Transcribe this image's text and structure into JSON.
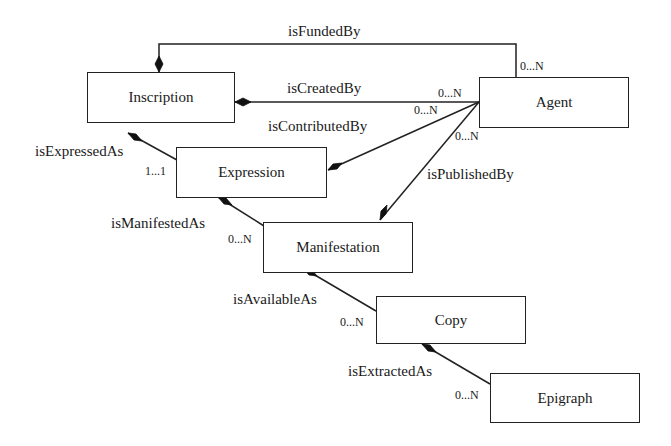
{
  "diagram": {
    "type": "UML class / entity-relationship diagram",
    "entities": [
      {
        "id": "inscription",
        "label": "Inscription"
      },
      {
        "id": "agent",
        "label": "Agent"
      },
      {
        "id": "expression",
        "label": "Expression"
      },
      {
        "id": "manifestation",
        "label": "Manifestation"
      },
      {
        "id": "copy",
        "label": "Copy"
      },
      {
        "id": "epigraph",
        "label": "Epigraph"
      }
    ],
    "relations": [
      {
        "id": "funded",
        "label": "isFundedBy",
        "from": "Inscription",
        "to": "Agent",
        "cardinality": "0...N"
      },
      {
        "id": "created",
        "label": "isCreatedBy",
        "from": "Inscription",
        "to": "Agent",
        "cardinality": "0...N"
      },
      {
        "id": "contributed",
        "label": "isContributedBy",
        "from": "Expression",
        "to": "Agent",
        "cardinality": "0...N"
      },
      {
        "id": "published",
        "label": "isPublishedBy",
        "from": "Manifestation",
        "to": "Agent",
        "cardinality": "0...N"
      },
      {
        "id": "expressed",
        "label": "isExpressedAs",
        "from": "Inscription",
        "to": "Expression",
        "cardinality": "1...1"
      },
      {
        "id": "manifested",
        "label": "isManifestedAs",
        "from": "Expression",
        "to": "Manifestation",
        "cardinality": "0...N"
      },
      {
        "id": "available",
        "label": "isAvailableAs",
        "from": "Manifestation",
        "to": "Copy",
        "cardinality": "0...N"
      },
      {
        "id": "extracted",
        "label": "isExtractedAs",
        "from": "Copy",
        "to": "Epigraph",
        "cardinality": "0...N"
      }
    ]
  }
}
